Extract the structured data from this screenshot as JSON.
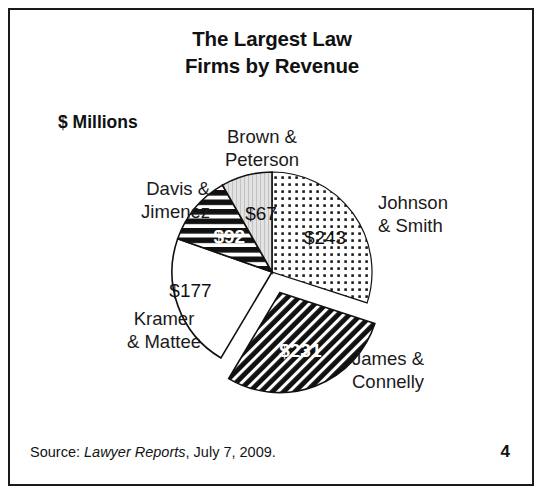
{
  "slide": {
    "title_line1": "The Largest Law",
    "title_line2": "Firms by Revenue",
    "units_label": "$ Millions",
    "page_number": "4",
    "border_color": "#1a1a1a",
    "background_color": "#ffffff"
  },
  "source": {
    "prefix": "Source: ",
    "publication": "Lawyer Reports",
    "suffix": ", July 7, 2009."
  },
  "labels": {
    "brown_line1": "Brown &",
    "brown_line2": "Peterson",
    "davis_line1": "Davis &",
    "davis_line2": "Jimenez",
    "johnson_line1": "Johnson",
    "johnson_line2": "& Smith",
    "kramer_line1": "Kramer",
    "kramer_line2": "& Mattee",
    "james_line1": "James &",
    "james_line2": "Connelly"
  },
  "values": {
    "johnson": "$243",
    "james": "$231",
    "kramer": "$177",
    "davis": "$92",
    "brown": "$67"
  },
  "chart_data": {
    "type": "pie",
    "title": "The Largest Law Firms by Revenue",
    "subtitle": "",
    "xlabel": "",
    "ylabel": "$ Millions",
    "units": "$ Millions",
    "total": 810,
    "legend": "none-labels-attached-to-slices",
    "grid": false,
    "start_angle_deg": 0,
    "direction": "clockwise",
    "categories": [
      "Johnson & Smith",
      "James & Connelly",
      "Kramer & Mattee",
      "Davis & Jimenez",
      "Brown & Peterson"
    ],
    "values": [
      243,
      231,
      177,
      92,
      67
    ],
    "data_labels": [
      "$243",
      "$231",
      "$177",
      "$92",
      "$67"
    ],
    "percentages": [
      30.0,
      28.5,
      21.9,
      11.4,
      8.3
    ],
    "slices": [
      {
        "name": "Johnson & Smith",
        "value": 243,
        "label": "$243",
        "percent": 30.0,
        "start_deg": 0.0,
        "sweep_deg": 108.0,
        "fill": "dotted",
        "exploded": false,
        "label_color": "#111111"
      },
      {
        "name": "James & Connelly",
        "value": 231,
        "label": "$231",
        "percent": 28.5,
        "start_deg": 108.0,
        "sweep_deg": 102.7,
        "fill": "diagonal-stripes",
        "exploded": true,
        "label_color": "#ffffff"
      },
      {
        "name": "Kramer & Mattee",
        "value": 177,
        "label": "$177",
        "percent": 21.9,
        "start_deg": 210.7,
        "sweep_deg": 78.7,
        "fill": "white",
        "exploded": false,
        "label_color": "#111111"
      },
      {
        "name": "Davis & Jimenez",
        "value": 92,
        "label": "$92",
        "percent": 11.4,
        "start_deg": 289.4,
        "sweep_deg": 40.9,
        "fill": "horizontal-stripes",
        "exploded": false,
        "label_color": "#ffffff"
      },
      {
        "name": "Brown & Peterson",
        "value": 67,
        "label": "$67",
        "percent": 8.3,
        "start_deg": 330.3,
        "sweep_deg": 29.7,
        "fill": "light-gray-vertical-lines",
        "exploded": false,
        "label_color": "#111111"
      }
    ]
  }
}
